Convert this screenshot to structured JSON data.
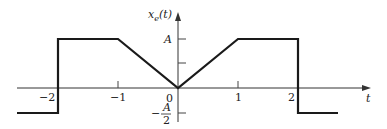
{
  "diagram": {
    "y_axis_label": "x",
    "y_axis_subscript": "e",
    "y_axis_arg": "(t)",
    "x_axis_label": "t",
    "y_ticks": {
      "A": "A",
      "neg_half_num": "A",
      "neg_half_sign": "−",
      "neg_half_den": "2"
    },
    "x_ticks": {
      "m2": "−2",
      "m1": "−1",
      "zero": "0",
      "p1": "1",
      "p2": "2"
    },
    "colors": {
      "signal": "#1a1a1a",
      "axis": "#333333"
    },
    "signal_points": [
      [
        -2.6,
        -0.5
      ],
      [
        -2,
        -0.5
      ],
      [
        -2,
        1
      ],
      [
        -1,
        1
      ],
      [
        0,
        0
      ],
      [
        1,
        1
      ],
      [
        2,
        1
      ],
      [
        2,
        -0.5
      ],
      [
        2.6,
        -0.5
      ]
    ]
  }
}
